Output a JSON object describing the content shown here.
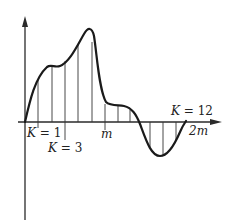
{
  "figure": {
    "labels": {
      "k1": "K = 1",
      "k3": "K = 3",
      "m": "m",
      "k12": "K = 12",
      "two_m": "2m"
    },
    "colors": {
      "curve": "#1a1a1a",
      "axis": "#2a2a2a",
      "ordinates": "#333333"
    }
  }
}
